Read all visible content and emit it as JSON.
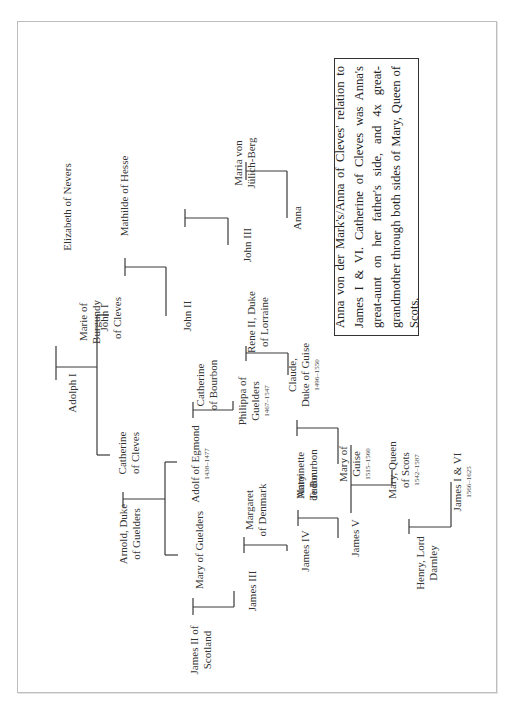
{
  "figure": {
    "orientation": "rotated-90-ccw",
    "caption": "Anna von der Mark's/Anna of Cleves' relation to James I & VI. Catherine of Cleves was Anna's great-aunt on her father's side, and 4x great-grandmother through both sides of Mary, Queen of Scots."
  },
  "people": {
    "adolph_i": {
      "lines": [
        "Adolph I"
      ]
    },
    "marie_of_burgundy": {
      "lines": [
        "Marie of",
        "Burgundy"
      ]
    },
    "john_i_of_cleves": {
      "lines": [
        "John I",
        "of Cleves"
      ]
    },
    "elizabeth_of_nevers": {
      "lines": [
        "Elizabeth of Nevers"
      ]
    },
    "catherine_of_cleves": {
      "lines": [
        "Catherine",
        "of Cleves"
      ]
    },
    "arnold_duke_of_guelders": {
      "lines": [
        "Arnold, Duke",
        "of Guelders"
      ]
    },
    "john_ii": {
      "lines": [
        "John II"
      ]
    },
    "mathilde_of_hesse": {
      "lines": [
        "Mathilde of Hesse"
      ]
    },
    "john_iii": {
      "lines": [
        "John III"
      ]
    },
    "maria_von_julich_berg": {
      "lines": [
        "Maria von",
        "Jülich-Berg"
      ]
    },
    "anna": {
      "lines": [
        "Anna"
      ]
    },
    "adolf_of_egmond": {
      "lines": [
        "Adolf of Egmond"
      ],
      "dates": "1438–1477"
    },
    "catherine_of_bourbon": {
      "lines": [
        "Catherine",
        "of Bourbon"
      ]
    },
    "mary_of_guelders": {
      "lines": [
        "Mary of Guelders"
      ]
    },
    "philippa_of_guelders": {
      "lines": [
        "Philippa of",
        "Guelders"
      ],
      "dates": "1467–1547"
    },
    "rene_ii_duke_of_lorraine": {
      "lines": [
        "Rene II, Duke",
        "of Lorraine"
      ]
    },
    "antoinette_de_bourbon": {
      "lines": [
        "Antoinette",
        "de Bourbon"
      ]
    },
    "claude_duke_of_guise": {
      "lines": [
        "Claude,",
        "Duke of Guise"
      ],
      "dates": "1496–1550"
    },
    "james_ii_of_scotland": {
      "lines": [
        "James II of",
        "Scotland"
      ]
    },
    "james_iii": {
      "lines": [
        "James III"
      ]
    },
    "margaret_of_denmark": {
      "lines": [
        "Margaret",
        "of Denmark"
      ]
    },
    "james_iv": {
      "lines": [
        "James IV"
      ]
    },
    "mary_tudor": {
      "lines": [
        "Mary",
        "Tudor"
      ]
    },
    "james_v": {
      "lines": [
        "James V"
      ]
    },
    "mary_of_guise": {
      "lines": [
        "Mary of",
        "Guise"
      ],
      "dates": "1515–1560"
    },
    "mary_queen_of_scots": {
      "lines": [
        "Mary, Queen",
        "of Scots"
      ],
      "dates": "1542–1587"
    },
    "henry_lord_darnley": {
      "lines": [
        "Henry, Lord",
        "Darnley"
      ]
    },
    "james_i_and_vi": {
      "lines": [
        "James I & VI"
      ],
      "dates": "1566–1625"
    }
  }
}
